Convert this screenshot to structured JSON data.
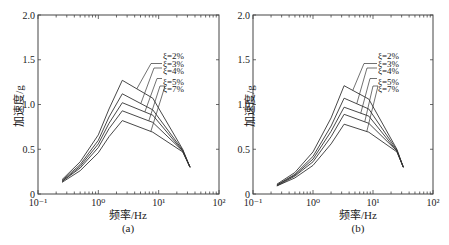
{
  "chart_data": [
    {
      "type": "line",
      "panel": "(a)",
      "xlabel": "频率/Hz",
      "ylabel": "加速度/g",
      "xscale": "log",
      "xlim": [
        0.1,
        100
      ],
      "ylim": [
        0,
        2.0
      ],
      "xticks": [
        "10⁻¹",
        "10⁰",
        "10¹",
        "10²"
      ],
      "yticks": [
        "0",
        "0.5",
        "1.0",
        "1.5",
        "2.0"
      ],
      "grid": false,
      "legend": [
        "ξ=2%",
        "ξ=3%",
        "ξ=4%",
        "ξ=5%",
        "ξ=7%"
      ],
      "x": [
        0.25,
        0.5,
        1.0,
        1.5,
        2.5,
        8.0,
        25.0,
        33.0
      ],
      "series": [
        {
          "name": "ξ=2%",
          "values": [
            0.16,
            0.36,
            0.66,
            0.95,
            1.27,
            1.07,
            0.5,
            0.3
          ]
        },
        {
          "name": "ξ=3%",
          "values": [
            0.15,
            0.33,
            0.6,
            0.86,
            1.12,
            0.94,
            0.49,
            0.3
          ]
        },
        {
          "name": "ξ=4%",
          "values": [
            0.14,
            0.31,
            0.56,
            0.79,
            1.02,
            0.88,
            0.48,
            0.3
          ]
        },
        {
          "name": "ξ=5%",
          "values": [
            0.14,
            0.29,
            0.52,
            0.73,
            0.93,
            0.8,
            0.48,
            0.3
          ]
        },
        {
          "name": "ξ=7%",
          "values": [
            0.13,
            0.26,
            0.46,
            0.64,
            0.82,
            0.69,
            0.47,
            0.3
          ]
        }
      ]
    },
    {
      "type": "line",
      "panel": "(b)",
      "xlabel": "频率/Hz",
      "ylabel": "加速度/g",
      "xscale": "log",
      "xlim": [
        0.1,
        100
      ],
      "ylim": [
        0,
        2.0
      ],
      "xticks": [
        "10⁻¹",
        "10⁰",
        "10¹",
        "10²"
      ],
      "yticks": [
        "0",
        "0.5",
        "1.0",
        "1.5",
        "2.0"
      ],
      "grid": false,
      "legend": [
        "ξ=2%",
        "ξ=3%",
        "ξ=4%",
        "ξ=5%",
        "ξ=7%"
      ],
      "x": [
        0.25,
        0.5,
        1.0,
        2.0,
        3.3,
        8.5,
        25.0,
        32.0
      ],
      "series": [
        {
          "name": "ξ=2%",
          "values": [
            0.11,
            0.24,
            0.47,
            0.85,
            1.21,
            1.06,
            0.5,
            0.3
          ]
        },
        {
          "name": "ξ=3%",
          "values": [
            0.1,
            0.22,
            0.42,
            0.76,
            1.07,
            0.95,
            0.49,
            0.3
          ]
        },
        {
          "name": "ξ=4%",
          "values": [
            0.1,
            0.21,
            0.39,
            0.7,
            0.97,
            0.87,
            0.48,
            0.3
          ]
        },
        {
          "name": "ξ=5%",
          "values": [
            0.09,
            0.2,
            0.36,
            0.64,
            0.89,
            0.79,
            0.48,
            0.3
          ]
        },
        {
          "name": "ξ=7%",
          "values": [
            0.09,
            0.18,
            0.32,
            0.56,
            0.78,
            0.69,
            0.47,
            0.3
          ]
        }
      ]
    }
  ],
  "panels": {
    "a": {
      "caption": "(a)",
      "xlabel": "频率/Hz",
      "ylabel": "加速度/g"
    },
    "b": {
      "caption": "(b)",
      "xlabel": "频率/Hz",
      "ylabel": "加速度/g"
    }
  },
  "colors": {
    "line": "#333333",
    "axis": "#444444",
    "background": "#ffffff"
  }
}
